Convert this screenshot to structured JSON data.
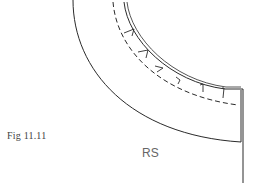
{
  "figure": {
    "caption": "Fig 11.11",
    "label": "RS"
  },
  "colors": {
    "line": "#2a2a2a",
    "caption": "#444444",
    "label": "#666666"
  }
}
